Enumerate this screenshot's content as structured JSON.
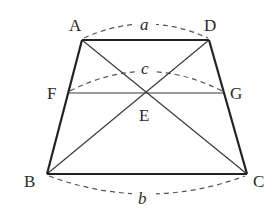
{
  "diagram": {
    "shape": "trapezoid",
    "points": {
      "A": {
        "label": "A",
        "x": 82,
        "y": 40
      },
      "D": {
        "label": "D",
        "x": 209,
        "y": 40
      },
      "B": {
        "label": "B",
        "x": 47,
        "y": 174
      },
      "C": {
        "label": "C",
        "x": 247,
        "y": 174
      },
      "F": {
        "label": "F",
        "x": 68,
        "y": 93
      },
      "G": {
        "label": "G",
        "x": 224,
        "y": 93
      },
      "E": {
        "label": "E",
        "x": 146,
        "y": 93
      }
    },
    "segments": [
      {
        "name": "AD",
        "from": "A",
        "to": "D",
        "style": "bold"
      },
      {
        "name": "BC",
        "from": "B",
        "to": "C",
        "style": "bold"
      },
      {
        "name": "AB",
        "from": "A",
        "to": "B",
        "style": "bold"
      },
      {
        "name": "DC",
        "from": "D",
        "to": "C",
        "style": "bold"
      },
      {
        "name": "AC",
        "from": "A",
        "to": "C",
        "style": "thin"
      },
      {
        "name": "BD",
        "from": "B",
        "to": "D",
        "style": "thin"
      },
      {
        "name": "FG",
        "from": "F",
        "to": "G",
        "style": "thin"
      }
    ],
    "lengths": {
      "a": {
        "label": "a",
        "segment": "AD"
      },
      "c": {
        "label": "c",
        "segment": "FG"
      },
      "b": {
        "label": "b",
        "segment": "BC"
      }
    },
    "colors": {
      "line": "#2a2a2a",
      "dashed": "#555555",
      "background": "#ffffff"
    }
  }
}
